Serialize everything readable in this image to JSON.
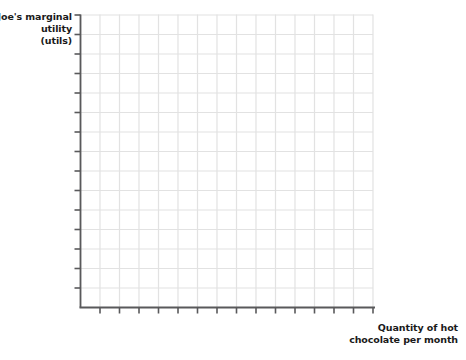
{
  "chart_data": {
    "type": "line",
    "title": "",
    "subtitle": "",
    "ylabel_lines": [
      "Joe's marginal",
      "utility",
      "(utils)"
    ],
    "ylabel": "Joe's marginal utility (utils)",
    "xlabel_lines": [
      "Quantity of hot",
      "chocolate per month"
    ],
    "xlabel": "Quantity of hot chocolate per month",
    "series": [],
    "categories": [],
    "values": [],
    "annotations": [],
    "legend": [],
    "legend_position": "none",
    "grid": true,
    "grid_columns": 15,
    "grid_rows": 15,
    "x_tick_count": 15,
    "y_tick_count": 15,
    "x_tick_labels": [],
    "y_tick_labels": [],
    "xlim": [
      0,
      15
    ],
    "ylim": [
      0,
      15
    ],
    "colors": {
      "gridline": "#e2e2e2",
      "axis": "#59595b",
      "text": "#1a1a1a",
      "background": "#ffffff"
    }
  },
  "axes": {
    "y_label_line1": "Joe's marginal",
    "y_label_line2": "utility",
    "y_label_line3": "(utils)",
    "x_label_line1": "Quantity of hot",
    "x_label_line2": "chocolate per month"
  }
}
